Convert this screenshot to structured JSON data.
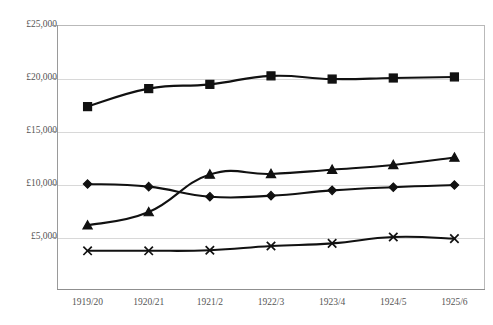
{
  "chart_data": {
    "type": "line",
    "title": "",
    "subtitle": "",
    "xlabel": "",
    "ylabel": "",
    "categories": [
      "1919/20",
      "1920/21",
      "1921/2",
      "1922/3",
      "1923/4",
      "1924/5",
      "1925/6"
    ],
    "ylim": [
      0,
      25000
    ],
    "yticks": [
      5000,
      10000,
      15000,
      20000,
      25000
    ],
    "ytick_labels": [
      "£5,000",
      "£10,000",
      "£15,000",
      "£20,000",
      "£25,000"
    ],
    "grid": true,
    "legend": "none",
    "currency_symbol": "£",
    "series": [
      {
        "name": "series-square",
        "marker": "square",
        "values": [
          17300,
          19000,
          19400,
          20200,
          19900,
          20000,
          20100
        ]
      },
      {
        "name": "series-triangle",
        "marker": "triangle",
        "values": [
          6100,
          7350,
          10900,
          10950,
          11350,
          11800,
          12500
        ]
      },
      {
        "name": "series-diamond",
        "marker": "diamond",
        "values": [
          10000,
          9750,
          8800,
          8900,
          9400,
          9700,
          9900
        ]
      },
      {
        "name": "series-cross",
        "marker": "cross",
        "values": [
          3700,
          3700,
          3750,
          4150,
          4400,
          5000,
          4850
        ]
      }
    ]
  },
  "top_crop_text": "",
  "colors": {
    "series_stroke": "#111111",
    "grid": "#d8d8d8",
    "axis": "#9a9a9a",
    "frame": "#b9b9b9",
    "label_text": "#555555",
    "background": "#ffffff"
  }
}
